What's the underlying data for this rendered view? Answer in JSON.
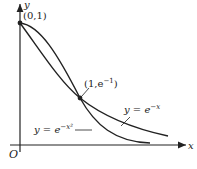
{
  "diagram": {
    "axes": {
      "x_label": "x",
      "y_label": "y",
      "origin_label": "O"
    },
    "points": [
      {
        "label": "(0,1)"
      },
      {
        "label": "(1,e",
        "sup": "−1",
        "close": ")"
      }
    ],
    "curves": [
      {
        "label_base": "y = e",
        "label_sup": "−x"
      },
      {
        "label_base": "y = e",
        "label_sup": "−x²"
      }
    ],
    "colors": {
      "ink": "#222222",
      "background": "#ffffff"
    }
  }
}
